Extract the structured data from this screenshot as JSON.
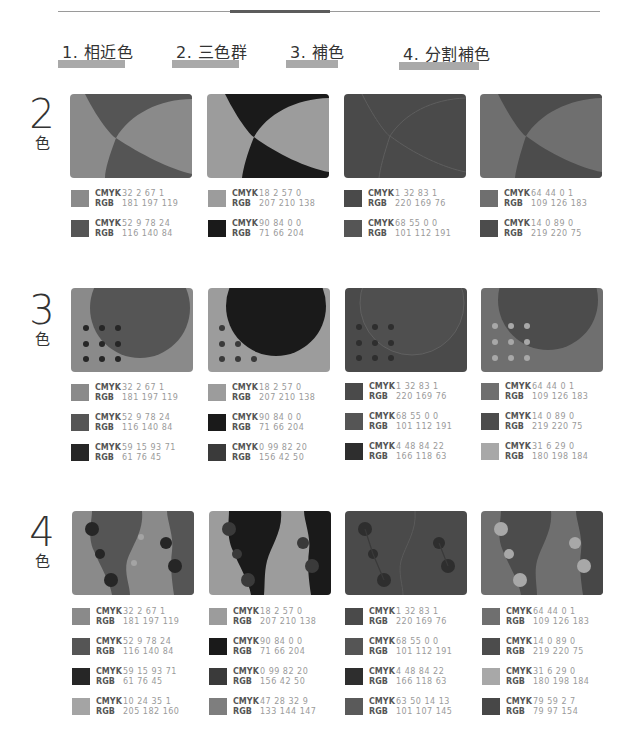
{
  "columns": [
    {
      "label": "1. 相近色"
    },
    {
      "label": "2. 三色群"
    },
    {
      "label": "3. 補色"
    },
    {
      "label": "4. 分割補色"
    }
  ],
  "rows": [
    {
      "number": "2",
      "suffix": "色"
    },
    {
      "number": "3",
      "suffix": "色"
    },
    {
      "number": "4",
      "suffix": "色"
    }
  ],
  "labels": {
    "cmyk": "CMYK",
    "rgb": "RGB"
  },
  "palettes": {
    "analogous": [
      {
        "cmyk": "32  2  67  1",
        "rgb": "181  197  119",
        "gray": "#8a8a8a"
      },
      {
        "cmyk": "52  9  78  24",
        "rgb": "116  140  84",
        "gray": "#555555"
      },
      {
        "cmyk": "59  15  93  71",
        "rgb": "61  76  45",
        "gray": "#262626"
      },
      {
        "cmyk": "10  24  35  1",
        "rgb": "205  182  160",
        "gray": "#a4a4a4"
      }
    ],
    "triad": [
      {
        "cmyk": "18  2  57  0",
        "rgb": "207  210  138",
        "gray": "#9c9c9c"
      },
      {
        "cmyk": "90  84  0  0",
        "rgb": "71  66  204",
        "gray": "#1a1a1a"
      },
      {
        "cmyk": "0  99  82  20",
        "rgb": "156  42  50",
        "gray": "#3a3a3a"
      },
      {
        "cmyk": "47  28  32  9",
        "rgb": "133  144  147",
        "gray": "#7e7e7e"
      }
    ],
    "complementary": [
      {
        "cmyk": "1  32  83  1",
        "rgb": "220  169  76",
        "gray": "#4a4a4a"
      },
      {
        "cmyk": "68  55  0  0",
        "rgb": "101  112  191",
        "gray": "#555555"
      },
      {
        "cmyk": "4  48  84  22",
        "rgb": "166  118  63",
        "gray": "#2e2e2e"
      },
      {
        "cmyk": "63  50  14  13",
        "rgb": "101  107  145",
        "gray": "#5a5a5a"
      }
    ],
    "split_complementary": [
      {
        "cmyk": "64  44  0  1",
        "rgb": "109  126  183",
        "gray": "#6f6f6f"
      },
      {
        "cmyk": "14  0  89  0",
        "rgb": "219  220  75",
        "gray": "#4c4c4c"
      },
      {
        "cmyk": "31  6  29  0",
        "rgb": "180  198  184",
        "gray": "#a8a8a8"
      },
      {
        "cmyk": "79  59  2  7",
        "rgb": "79  97  154",
        "gray": "#474747"
      }
    ]
  }
}
